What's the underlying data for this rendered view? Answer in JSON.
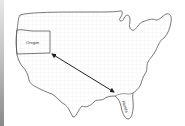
{
  "diagram": {
    "type": "map",
    "regions": [
      {
        "name": "Oregon",
        "label": "Oregon"
      },
      {
        "name": "Florida",
        "label": "Florida"
      }
    ],
    "connector": {
      "type": "double-headed-arrow",
      "from": "Oregon",
      "to": "Florida"
    },
    "colors": {
      "outline": "#555555",
      "fill": "#f6f6f6",
      "grid": "#e6e6e6",
      "arrow": "#222222"
    }
  }
}
